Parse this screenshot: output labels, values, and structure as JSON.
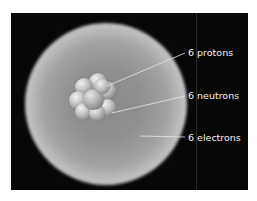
{
  "diagram": {
    "background_color": "#070707",
    "labels": [
      {
        "text": "6 protons",
        "x": 188,
        "y": 47
      },
      {
        "text": "6 neutrons",
        "x": 188,
        "y": 90
      },
      {
        "text": "6 electrons",
        "x": 188,
        "y": 132
      }
    ],
    "leader_lines": [
      {
        "x1": 107,
        "y1": 86,
        "x2": 185,
        "y2": 53
      },
      {
        "x1": 112,
        "y1": 113,
        "x2": 185,
        "y2": 96
      },
      {
        "x1": 140,
        "y1": 136,
        "x2": 185,
        "y2": 137
      }
    ]
  }
}
